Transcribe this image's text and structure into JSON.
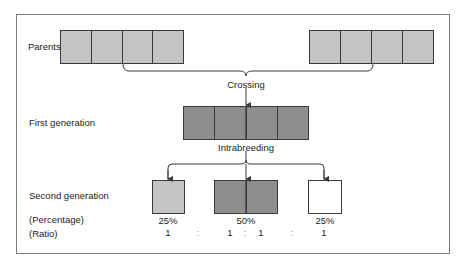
{
  "colors": {
    "parent_fill": "#c4c4c4",
    "first_gen_fill": "#8e8e8e",
    "second_light_fill": "#c4c4c4",
    "second_dark_fill": "#8e8e8e",
    "second_white_fill": "#ffffff",
    "line": "#3a3a3a"
  },
  "labels": {
    "parents": "Parents",
    "first_generation": "First generation",
    "second_generation": "Second generation",
    "percentage": "(Percentage)",
    "ratio": "(Ratio)"
  },
  "connectors": {
    "crossing": "Crossing",
    "intrabreeding": "Intrabreeding"
  },
  "parents": {
    "left_cells": 4,
    "right_cells": 4
  },
  "first_generation": {
    "cells": 4
  },
  "second_generation": {
    "groups": [
      {
        "id": "left",
        "percentage": "25%",
        "ratio": [
          "1"
        ]
      },
      {
        "id": "middle",
        "percentage": "50%",
        "ratio": [
          "1",
          "1"
        ]
      },
      {
        "id": "right",
        "percentage": "25%",
        "ratio": [
          "1"
        ]
      }
    ],
    "separators": [
      ":",
      ":",
      ":"
    ]
  }
}
